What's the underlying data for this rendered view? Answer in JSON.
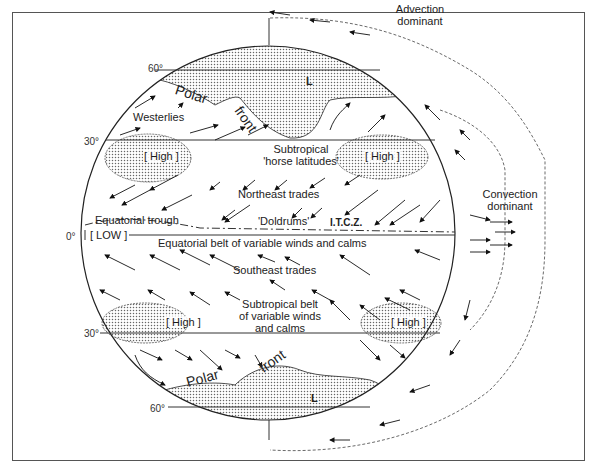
{
  "diagram": {
    "latitudes": [
      "60°",
      "30°",
      "0°",
      "30°",
      "60°"
    ],
    "pressure_labels": {
      "high_nw": "[ High ]",
      "high_ne": "[ High ]",
      "high_sw": "[ High ]",
      "high_se": "[ High ]",
      "low_equator": "[ LOW ]",
      "low_north": "L",
      "low_south": "L"
    },
    "zones": {
      "westerlies": "Westerlies",
      "subtropical_north": [
        "Subtropical",
        "'horse latitudes'"
      ],
      "northeast_trades": "Northeast trades",
      "doldrums": "'Doldrums'",
      "itcz": "I.T.C.Z.",
      "equatorial_trough": "Equatorial trough",
      "equatorial_belt": "Equatorial belt of variable winds and calms",
      "southeast_trades": "Southeast trades",
      "subtropical_south": [
        "Subtropical belt",
        "of variable winds",
        "and calms"
      ]
    },
    "fronts": {
      "north_polar": "Polar",
      "north_front": "front",
      "south_polar": "Polar",
      "south_front": "front"
    },
    "side_annotations": {
      "advection": [
        "Advection",
        "dominant"
      ],
      "convection": [
        "Convection",
        "dominant"
      ]
    },
    "colors": {
      "line": "#222222",
      "stipple": "#888888",
      "frame": "#555555"
    }
  }
}
